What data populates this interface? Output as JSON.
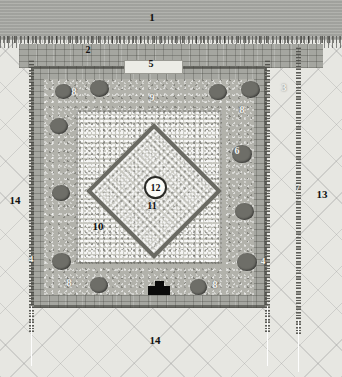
{
  "figure": {
    "kind": "archaeological-site-plan",
    "palette": {
      "sky_band": "#a9aaa5",
      "ground": "#e7e7e2",
      "masonry": "#a5a6a0",
      "rubble": "#b2b2ab",
      "gravel": "#c8c8c1",
      "tree": "#6e6e68",
      "monument": "#0b0b0b",
      "label_dark": "#111111",
      "label_light": "#f2f2ee"
    }
  },
  "labels": [
    {
      "id": "1",
      "text": "1",
      "style": "dark",
      "x": 152,
      "y": 17,
      "size": 11
    },
    {
      "id": "2",
      "text": "2",
      "style": "dark",
      "x": 88,
      "y": 50,
      "size": 10
    },
    {
      "id": "3",
      "text": "3",
      "style": "light",
      "x": 284,
      "y": 88,
      "size": 10
    },
    {
      "id": "4L",
      "text": "4",
      "style": "light",
      "x": 31,
      "y": 259,
      "size": 9
    },
    {
      "id": "4R",
      "text": "4",
      "style": "light",
      "x": 263,
      "y": 261,
      "size": 9
    },
    {
      "id": "5",
      "text": "5",
      "style": "dark",
      "x": 151,
      "y": 64,
      "size": 10
    },
    {
      "id": "6",
      "text": "6",
      "style": "oncircle",
      "x": 237,
      "y": 151,
      "size": 10
    },
    {
      "id": "7",
      "text": "7",
      "style": "light",
      "x": 298,
      "y": 187,
      "size": 9
    },
    {
      "id": "8TL",
      "text": "8",
      "style": "light",
      "x": 74,
      "y": 92,
      "size": 10
    },
    {
      "id": "8TR",
      "text": "8",
      "style": "light",
      "x": 242,
      "y": 110,
      "size": 10
    },
    {
      "id": "8BL",
      "text": "8",
      "style": "light",
      "x": 69,
      "y": 283,
      "size": 10
    },
    {
      "id": "8BR",
      "text": "8",
      "style": "light",
      "x": 215,
      "y": 285,
      "size": 10
    },
    {
      "id": "9",
      "text": "9",
      "style": "light",
      "x": 152,
      "y": 98,
      "size": 10
    },
    {
      "id": "10",
      "text": "10",
      "style": "dark",
      "x": 98,
      "y": 226,
      "size": 11
    },
    {
      "id": "11",
      "text": "11",
      "style": "dark",
      "x": 152,
      "y": 206,
      "size": 10
    },
    {
      "id": "12",
      "text": "12",
      "style": "circled",
      "x": 153,
      "y": 185,
      "size": 10
    },
    {
      "id": "13",
      "text": "13",
      "style": "dark",
      "x": 322,
      "y": 194,
      "size": 11
    },
    {
      "id": "14L",
      "text": "14",
      "style": "dark",
      "x": 15,
      "y": 200,
      "size": 11
    },
    {
      "id": "14B",
      "text": "14",
      "style": "dark",
      "x": 155,
      "y": 340,
      "size": 11
    }
  ],
  "trees": [
    {
      "x": 55,
      "y": 84,
      "w": 17,
      "h": 15
    },
    {
      "x": 90,
      "y": 80,
      "w": 19,
      "h": 17
    },
    {
      "x": 209,
      "y": 84,
      "w": 18,
      "h": 16
    },
    {
      "x": 241,
      "y": 81,
      "w": 19,
      "h": 17
    },
    {
      "x": 50,
      "y": 118,
      "w": 18,
      "h": 16
    },
    {
      "x": 232,
      "y": 145,
      "w": 20,
      "h": 18
    },
    {
      "x": 52,
      "y": 185,
      "w": 18,
      "h": 16
    },
    {
      "x": 235,
      "y": 203,
      "w": 19,
      "h": 17
    },
    {
      "x": 52,
      "y": 253,
      "w": 19,
      "h": 17
    },
    {
      "x": 237,
      "y": 253,
      "w": 20,
      "h": 18
    },
    {
      "x": 90,
      "y": 277,
      "w": 18,
      "h": 16
    },
    {
      "x": 190,
      "y": 279,
      "w": 17,
      "h": 16
    }
  ],
  "gate": {
    "x": 124,
    "y": 60,
    "w": 57,
    "h": 12
  },
  "monument": {
    "x": 148,
    "y": 286,
    "w": 22,
    "h": 9,
    "cap_x": 155,
    "cap_y": 281,
    "cap_w": 9,
    "cap_h": 6
  }
}
